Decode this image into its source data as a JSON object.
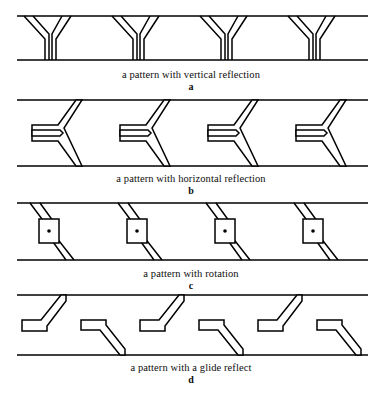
{
  "figure": {
    "width": 382,
    "height": 395,
    "stroke_color": "#000000",
    "background_color": "#ffffff",
    "band_left": 17,
    "band_right": 368
  },
  "panels": [
    {
      "id": "panel-a",
      "caption": "a pattern with vertical reflection",
      "sublabel": "a",
      "symmetry": "vertical reflection",
      "motif": "upright-Y",
      "repeats": 4,
      "band_top_y": 18,
      "band_bottom_y": 62,
      "motif_pitch": 88,
      "motif_first_x": 24
    },
    {
      "id": "panel-b",
      "caption": "a pattern with horizontal reflection",
      "sublabel": "b",
      "symmetry": "horizontal reflection",
      "motif": "sideways-Y-pointing-left",
      "repeats": 4,
      "band_top_y": 100,
      "band_bottom_y": 166,
      "motif_pitch": 88,
      "motif_first_x": 32
    },
    {
      "id": "panel-c",
      "caption": "a pattern with rotation",
      "sublabel": "c",
      "symmetry": "rotation",
      "motif": "diagonal-band-with-boxed-dot",
      "repeats": 4,
      "band_top_y": 203,
      "band_bottom_y": 260,
      "motif_pitch": 88,
      "motif_first_x": 30
    },
    {
      "id": "panel-d",
      "caption": "a pattern with a glide reflect",
      "sublabel": "d",
      "symmetry": "glide reflection",
      "motif": "alternating-up-and-down-hooks",
      "repeats": 6,
      "band_top_y": 295,
      "band_bottom_y": 355,
      "motif_pitch": 59,
      "motif_first_x": 22
    }
  ]
}
